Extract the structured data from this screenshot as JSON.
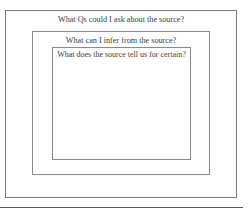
{
  "diagram": {
    "type": "nested-boxes",
    "outer": {
      "label": "What Qs could I ask about the source?"
    },
    "middle": {
      "label": "What can I infer from the source?"
    },
    "inner": {
      "label": "What does the source tell us for certain?"
    }
  },
  "colors": {
    "border": "#8a8a8a",
    "text": "#3d3d3d",
    "background": "#ffffff"
  }
}
